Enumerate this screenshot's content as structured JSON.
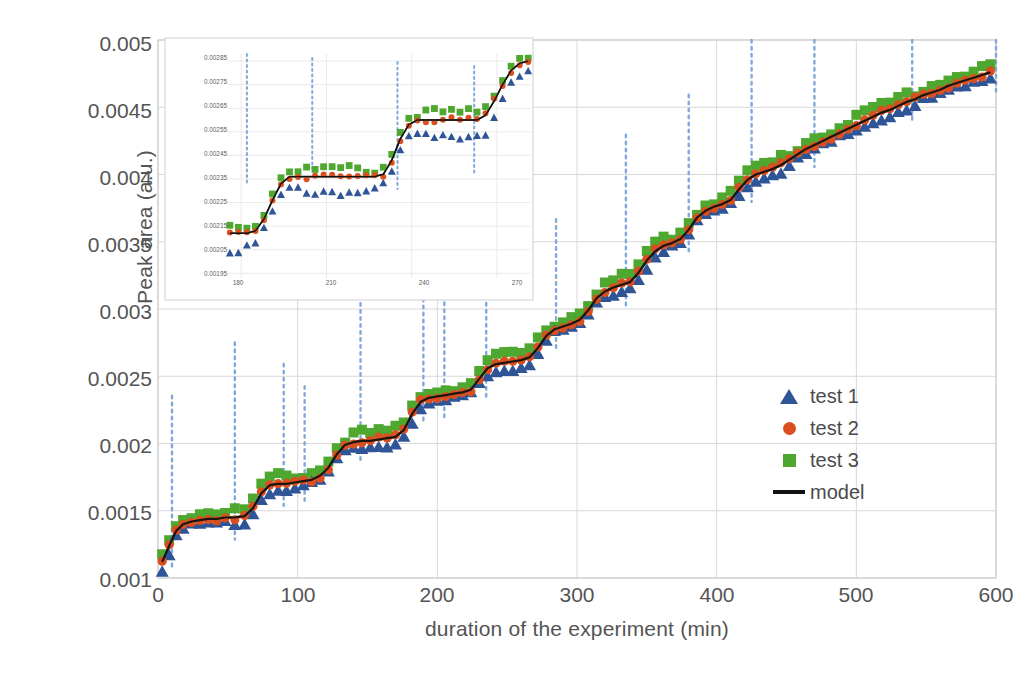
{
  "chart_data": {
    "type": "scatter",
    "title": "",
    "xlabel": "duration of the experiment (min)",
    "ylabel": "Peak area (a.u.)",
    "xlim": [
      0,
      600
    ],
    "ylim": [
      0.001,
      0.005
    ],
    "xticks": [
      0,
      100,
      200,
      300,
      400,
      500,
      600
    ],
    "yticks": [
      0.001,
      0.0015,
      0.002,
      0.0025,
      0.003,
      0.0035,
      0.004,
      0.0045,
      0.005
    ],
    "grid": true,
    "legend_position": "right-middle",
    "legend": [
      {
        "label": "test 1",
        "marker": "triangle",
        "color": "#2f5597"
      },
      {
        "label": "test 2",
        "marker": "circle",
        "color": "#d94f20"
      },
      {
        "label": "test 3",
        "marker": "square",
        "color": "#4ea72e"
      },
      {
        "label": "model",
        "marker": "line",
        "color": "#111111"
      }
    ],
    "event_markers_x": [
      10,
      55,
      90,
      105,
      145,
      190,
      205,
      235,
      285,
      335,
      380,
      425,
      470,
      540,
      600
    ],
    "series": [
      {
        "name": "model",
        "x": [
          3,
          8,
          13,
          18,
          24,
          30,
          36,
          42,
          48,
          55,
          62,
          68,
          74,
          80,
          86,
          92,
          98,
          104,
          110,
          116,
          122,
          128,
          134,
          140,
          146,
          152,
          158,
          164,
          170,
          176,
          182,
          188,
          194,
          200,
          206,
          212,
          218,
          224,
          230,
          236,
          242,
          248,
          254,
          260,
          266,
          272,
          278,
          284,
          290,
          296,
          302,
          308,
          314,
          320,
          326,
          332,
          338,
          344,
          350,
          356,
          362,
          368,
          374,
          380,
          386,
          392,
          398,
          404,
          410,
          416,
          422,
          428,
          434,
          440,
          446,
          452,
          458,
          464,
          470,
          476,
          482,
          488,
          494,
          500,
          506,
          512,
          518,
          524,
          530,
          536,
          542,
          548,
          554,
          560,
          566,
          572,
          578,
          584,
          590,
          596
        ],
        "y": [
          0.00112,
          0.00124,
          0.00135,
          0.0014,
          0.00142,
          0.00143,
          0.00144,
          0.00144,
          0.00145,
          0.00145,
          0.00146,
          0.00152,
          0.00163,
          0.00169,
          0.0017,
          0.0017,
          0.00171,
          0.00172,
          0.00173,
          0.00176,
          0.00182,
          0.00192,
          0.00199,
          0.00201,
          0.00202,
          0.00202,
          0.00203,
          0.00204,
          0.00205,
          0.0021,
          0.00222,
          0.00231,
          0.00234,
          0.00235,
          0.00236,
          0.00237,
          0.00238,
          0.0024,
          0.00248,
          0.00256,
          0.00259,
          0.0026,
          0.00261,
          0.00262,
          0.00264,
          0.00271,
          0.0028,
          0.00285,
          0.00287,
          0.00289,
          0.00292,
          0.00299,
          0.00308,
          0.00313,
          0.00316,
          0.00318,
          0.0032,
          0.00327,
          0.00336,
          0.00343,
          0.00347,
          0.00349,
          0.00352,
          0.00359,
          0.00368,
          0.00373,
          0.00376,
          0.00378,
          0.00381,
          0.00389,
          0.00396,
          0.004,
          0.00402,
          0.00404,
          0.00407,
          0.00411,
          0.00415,
          0.00419,
          0.00422,
          0.00425,
          0.00428,
          0.00431,
          0.00434,
          0.00437,
          0.0044,
          0.00443,
          0.00446,
          0.00448,
          0.00451,
          0.00454,
          0.00456,
          0.00459,
          0.00461,
          0.00463,
          0.00466,
          0.00468,
          0.0047,
          0.00472,
          0.00474,
          0.00476
        ]
      },
      {
        "name": "test 1",
        "offset": -4e-05,
        "note": "blue triangles sit slightly below the model trace"
      },
      {
        "name": "test 2",
        "offset": 0.0,
        "note": "red circles lie essentially on the model trace"
      },
      {
        "name": "test 3",
        "offset": 5e-05,
        "note": "green squares sit slightly above the model trace"
      }
    ]
  },
  "inset": {
    "xlabel": "",
    "ylabel": "",
    "xlim": [
      175,
      282
    ],
    "ylim": [
      0.00193,
      0.00288
    ],
    "xticks": [
      180,
      210,
      240,
      270
    ],
    "yticks": [
      0.00195,
      0.00205,
      0.00215,
      0.00225,
      0.00235,
      0.00245,
      0.00255,
      0.00265,
      0.00275,
      0.00285
    ],
    "ytick_labels": [
      "0.00195",
      "0.00205",
      "0.00215",
      "0.00225",
      "0.00235",
      "0.00245",
      "0.00255",
      "0.00265",
      "0.00275",
      "0.00285"
    ],
    "xtick_labels": [
      "180",
      "210",
      "240",
      "270"
    ],
    "event_markers_x": [
      182,
      205,
      235,
      262
    ],
    "series": [
      {
        "name": "model",
        "x": [
          176,
          179,
          182,
          185,
          188,
          191,
          194,
          197,
          200,
          203,
          206,
          209,
          212,
          215,
          218,
          221,
          224,
          227,
          230,
          233,
          236,
          239,
          242,
          245,
          248,
          251,
          254,
          257,
          260,
          263,
          266,
          269,
          272,
          275,
          278,
          281
        ],
        "y": [
          0.00212,
          0.00212,
          0.00212,
          0.00213,
          0.00218,
          0.00226,
          0.00233,
          0.00236,
          0.00236,
          0.00236,
          0.00236,
          0.00236,
          0.00236,
          0.00236,
          0.00236,
          0.00236,
          0.00236,
          0.00236,
          0.00237,
          0.00243,
          0.00252,
          0.00258,
          0.0026,
          0.0026,
          0.0026,
          0.0026,
          0.0026,
          0.0026,
          0.0026,
          0.0026,
          0.00262,
          0.00268,
          0.00275,
          0.00281,
          0.00284,
          0.00285
        ]
      }
    ]
  },
  "legend": {
    "items": [
      {
        "label": "test 1"
      },
      {
        "label": "test 2"
      },
      {
        "label": "test 3"
      },
      {
        "label": "model"
      }
    ]
  },
  "colors": {
    "test1": "#2f5597",
    "test2": "#d94f20",
    "test3": "#4ea72e",
    "model": "#111111",
    "event_marker": "#7fa8dc",
    "grid": "#d8d8d8",
    "text": "#545454"
  }
}
